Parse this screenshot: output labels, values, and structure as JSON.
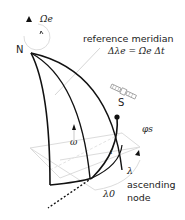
{
  "diagram": {
    "labels": {
      "north": "N",
      "omega_dot_e": "Ω̇e",
      "reference_meridian": "reference meridian",
      "delta_lambda_eq": "Δλe = Ω̇e Δt",
      "satellite": "S",
      "latitude": "φs",
      "omega": "ω",
      "inclination": "i",
      "lambda": "λ",
      "lambda0": "λ0",
      "ascending_node_line1": "ascending",
      "ascending_node_line2": "node"
    },
    "colors": {
      "ink": "#111111",
      "guide": "#cccccc",
      "text": "#222222"
    }
  }
}
